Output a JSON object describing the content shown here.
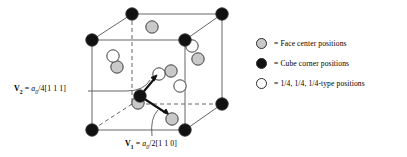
{
  "figure": {
    "background_color": "#ffffff",
    "line_color": "#555555",
    "stroke_color": "#2b2b2b"
  },
  "legend": {
    "items": [
      {
        "marker": "face-center-circle",
        "fill": "#c9c9c9",
        "label": "= Face center positions"
      },
      {
        "marker": "cube-corner-circle",
        "fill": "#111111",
        "label": "= Cube corner positions"
      },
      {
        "marker": "quarter-position-circle",
        "fill": "#ffffff",
        "label": "= 1/4, 1/4, 1/4-type positions"
      }
    ]
  },
  "vectors": [
    {
      "id": "v2",
      "name": "V",
      "subscript": "2",
      "equals": "=",
      "lattice_param": "a",
      "lattice_sub": "0",
      "expression": "/4[1 1 1]",
      "full_text": "V2 = a0/4[1 1 1]"
    },
    {
      "id": "v1",
      "name": "V",
      "subscript": "1",
      "equals": "=",
      "lattice_param": "a",
      "lattice_sub": "0",
      "expression": "/2[1 1 0]",
      "full_text": "V1 = a0/2[1 1 0]"
    }
  ],
  "cube": {
    "front_top_left": [
      92,
      40
    ],
    "front_top_right": [
      185,
      40
    ],
    "front_bottom_left": [
      92,
      130
    ],
    "front_bottom_right": [
      185,
      130
    ],
    "back_top_left": [
      132,
      14
    ],
    "back_top_right": [
      222,
      14
    ],
    "back_bottom_left": [
      132,
      104
    ],
    "back_bottom_right": [
      222,
      104
    ]
  },
  "atoms": {
    "corner_radius": 6.2,
    "face_radius": 6.2,
    "quarter_radius": 6.2,
    "corner_fill": "#111111",
    "face_fill": "#c9c9c9",
    "quarter_fill": "#ffffff",
    "corners": [
      [
        92,
        40
      ],
      [
        185,
        40
      ],
      [
        92,
        130
      ],
      [
        185,
        130
      ],
      [
        132,
        14
      ],
      [
        222,
        14
      ],
      [
        222,
        104
      ]
    ],
    "face_centers": [
      [
        152,
        27
      ],
      [
        117,
        67
      ],
      [
        198,
        59
      ],
      [
        171,
        71
      ],
      [
        138,
        103
      ],
      [
        172,
        119
      ]
    ],
    "quarter_positions": [
      [
        113,
        56
      ],
      [
        192,
        46
      ],
      [
        180,
        86
      ],
      [
        159,
        74
      ]
    ]
  }
}
